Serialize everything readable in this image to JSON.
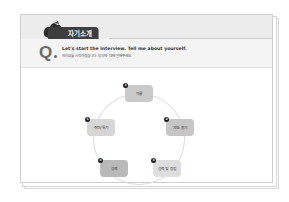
{
  "header": {
    "badge_label": "자기소개"
  },
  "question": {
    "marker": "Q",
    "english": "Let's start the interview. Tell me about yourself.",
    "korean": "인터뷰를 시작하겠습니다. 당신에 대해 말해주세요."
  },
  "diagram": {
    "nodes": [
      {
        "num": "1",
        "label": "이름",
        "color": "#c9c9c9"
      },
      {
        "num": "2",
        "label": "지원 동기",
        "color": "#c6c6c6"
      },
      {
        "num": "3",
        "label": "성격 및 장점",
        "color": "#dedede"
      },
      {
        "num": "4",
        "label": "성격",
        "color": "#b9b9b9"
      },
      {
        "num": "5",
        "label": "취미/특기",
        "color": "#d6d6d6"
      }
    ]
  },
  "colors": {
    "badge": "#3e3e3e",
    "header_band": "#ececec",
    "question_band": "#f4f4f4",
    "number_dot": "#1e1e1e"
  }
}
